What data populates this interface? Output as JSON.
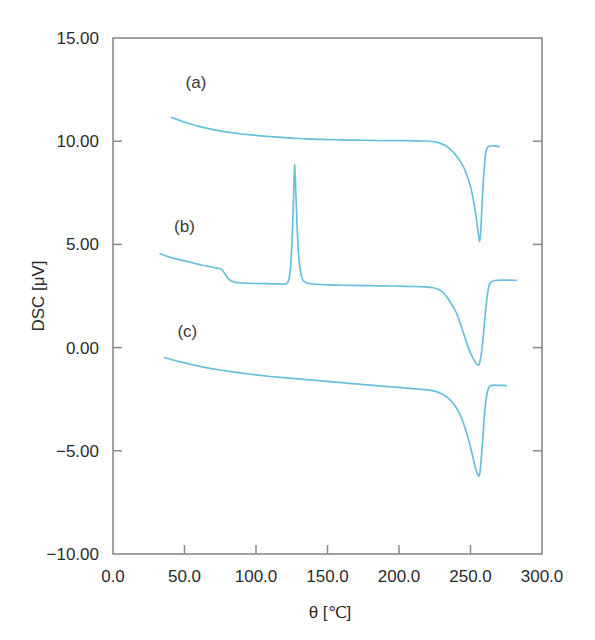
{
  "chart_data": {
    "type": "line",
    "title": "",
    "xlabel": "θ [℃]",
    "ylabel": "DSC [μV]",
    "xlim": [
      0.0,
      300.0
    ],
    "ylim": [
      -10.0,
      15.0
    ],
    "grid": false,
    "legend_position": "inline-annotations",
    "line_color": "#68c0de",
    "xticks": [
      "0.0",
      "50.0",
      "100.0",
      "150.0",
      "200.0",
      "250.0",
      "300.0"
    ],
    "xtick_values": [
      0,
      50,
      100,
      150,
      200,
      250,
      300
    ],
    "yticks": [
      "15.00",
      "10.00",
      "5.00",
      "0.00",
      "−5.00",
      "−10.00"
    ],
    "ytick_values": [
      15,
      10,
      5,
      0,
      -5,
      -10
    ],
    "annotations": [
      {
        "text": "(a)",
        "x": 58,
        "y": 12.6
      },
      {
        "text": "(b)",
        "x": 50,
        "y": 5.6
      },
      {
        "text": "(c)",
        "x": 52,
        "y": 0.5
      }
    ],
    "series": [
      {
        "name": "(a)",
        "label": "(a)",
        "color": "#68c0de",
        "baseline": 10.0,
        "onset_temp": 228,
        "peak_temp": 256,
        "peak_min": 5.15,
        "end_temp": 270,
        "end_value": 9.75,
        "points": [
          [
            41,
            11.15
          ],
          [
            46,
            11.02
          ],
          [
            52,
            10.88
          ],
          [
            60,
            10.72
          ],
          [
            70,
            10.56
          ],
          [
            80,
            10.44
          ],
          [
            90,
            10.35
          ],
          [
            100,
            10.28
          ],
          [
            110,
            10.22
          ],
          [
            120,
            10.17
          ],
          [
            130,
            10.13
          ],
          [
            140,
            10.1
          ],
          [
            150,
            10.08
          ],
          [
            160,
            10.06
          ],
          [
            170,
            10.05
          ],
          [
            180,
            10.04
          ],
          [
            190,
            10.03
          ],
          [
            200,
            10.03
          ],
          [
            210,
            10.02
          ],
          [
            218,
            10.01
          ],
          [
            224,
            9.98
          ],
          [
            228,
            9.92
          ],
          [
            232,
            9.8
          ],
          [
            236,
            9.6
          ],
          [
            240,
            9.3
          ],
          [
            244,
            8.9
          ],
          [
            247,
            8.45
          ],
          [
            250,
            7.8
          ],
          [
            252,
            7.15
          ],
          [
            254,
            6.3
          ],
          [
            255.5,
            5.5
          ],
          [
            256.3,
            5.15
          ],
          [
            257.2,
            5.7
          ],
          [
            258,
            6.8
          ],
          [
            259,
            8.1
          ],
          [
            260,
            9.05
          ],
          [
            261,
            9.55
          ],
          [
            262.5,
            9.75
          ],
          [
            265,
            9.78
          ],
          [
            268,
            9.76
          ],
          [
            270,
            9.74
          ]
        ]
      },
      {
        "name": "(b)",
        "label": "(b)",
        "color": "#68c0de",
        "baseline": 3.15,
        "glass_transition_temp": 80,
        "crystallization_peak_temp": 127,
        "crystallization_peak_max": 8.85,
        "melt_peak_temp": 256,
        "melt_peak_min": -0.85,
        "end_temp": 282,
        "end_value": 3.25,
        "points": [
          [
            33,
            4.55
          ],
          [
            38,
            4.42
          ],
          [
            44,
            4.3
          ],
          [
            50,
            4.2
          ],
          [
            56,
            4.1
          ],
          [
            62,
            4.0
          ],
          [
            68,
            3.92
          ],
          [
            72,
            3.86
          ],
          [
            75,
            3.82
          ],
          [
            77,
            3.7
          ],
          [
            79,
            3.5
          ],
          [
            81,
            3.32
          ],
          [
            83,
            3.22
          ],
          [
            86,
            3.16
          ],
          [
            90,
            3.13
          ],
          [
            96,
            3.11
          ],
          [
            104,
            3.1
          ],
          [
            112,
            3.09
          ],
          [
            118,
            3.08
          ],
          [
            121,
            3.08
          ],
          [
            123,
            3.3
          ],
          [
            124.5,
            4.2
          ],
          [
            125.5,
            5.7
          ],
          [
            126.3,
            7.4
          ],
          [
            127,
            8.85
          ],
          [
            127.8,
            7.6
          ],
          [
            128.8,
            5.8
          ],
          [
            130,
            4.3
          ],
          [
            131.5,
            3.55
          ],
          [
            133,
            3.25
          ],
          [
            136,
            3.12
          ],
          [
            142,
            3.07
          ],
          [
            150,
            3.04
          ],
          [
            160,
            3.02
          ],
          [
            170,
            3.01
          ],
          [
            180,
            3.0
          ],
          [
            190,
            2.99
          ],
          [
            200,
            2.98
          ],
          [
            210,
            2.96
          ],
          [
            218,
            2.94
          ],
          [
            224,
            2.9
          ],
          [
            228,
            2.8
          ],
          [
            232,
            2.58
          ],
          [
            236,
            2.2
          ],
          [
            240,
            1.7
          ],
          [
            243,
            1.15
          ],
          [
            246,
            0.5
          ],
          [
            249,
            -0.1
          ],
          [
            252,
            -0.55
          ],
          [
            254,
            -0.78
          ],
          [
            255.5,
            -0.85
          ],
          [
            256.5,
            -0.7
          ],
          [
            258,
            -0.1
          ],
          [
            259.5,
            1.0
          ],
          [
            261,
            2.1
          ],
          [
            262.5,
            2.85
          ],
          [
            264,
            3.15
          ],
          [
            267,
            3.25
          ],
          [
            273,
            3.27
          ],
          [
            282,
            3.26
          ]
        ]
      },
      {
        "name": "(c)",
        "label": "(c)",
        "color": "#68c0de",
        "baseline": -2.0,
        "melt_peak_temp": 256,
        "melt_peak_min": -6.2,
        "end_temp": 275,
        "end_value": -1.85,
        "points": [
          [
            36,
            -0.48
          ],
          [
            42,
            -0.6
          ],
          [
            50,
            -0.74
          ],
          [
            60,
            -0.9
          ],
          [
            70,
            -1.03
          ],
          [
            80,
            -1.14
          ],
          [
            90,
            -1.24
          ],
          [
            100,
            -1.32
          ],
          [
            110,
            -1.4
          ],
          [
            120,
            -1.46
          ],
          [
            130,
            -1.52
          ],
          [
            140,
            -1.58
          ],
          [
            150,
            -1.64
          ],
          [
            160,
            -1.7
          ],
          [
            170,
            -1.76
          ],
          [
            180,
            -1.82
          ],
          [
            190,
            -1.88
          ],
          [
            200,
            -1.93
          ],
          [
            210,
            -1.99
          ],
          [
            218,
            -2.04
          ],
          [
            224,
            -2.1
          ],
          [
            228,
            -2.18
          ],
          [
            232,
            -2.32
          ],
          [
            236,
            -2.55
          ],
          [
            240,
            -2.9
          ],
          [
            243,
            -3.3
          ],
          [
            246,
            -3.85
          ],
          [
            249,
            -4.55
          ],
          [
            251.5,
            -5.25
          ],
          [
            253.5,
            -5.85
          ],
          [
            255,
            -6.15
          ],
          [
            256,
            -6.22
          ],
          [
            257,
            -5.8
          ],
          [
            258.3,
            -4.7
          ],
          [
            259.6,
            -3.4
          ],
          [
            261,
            -2.45
          ],
          [
            262.5,
            -1.98
          ],
          [
            264,
            -1.85
          ],
          [
            267,
            -1.82
          ],
          [
            271,
            -1.83
          ],
          [
            275,
            -1.84
          ]
        ]
      }
    ]
  }
}
